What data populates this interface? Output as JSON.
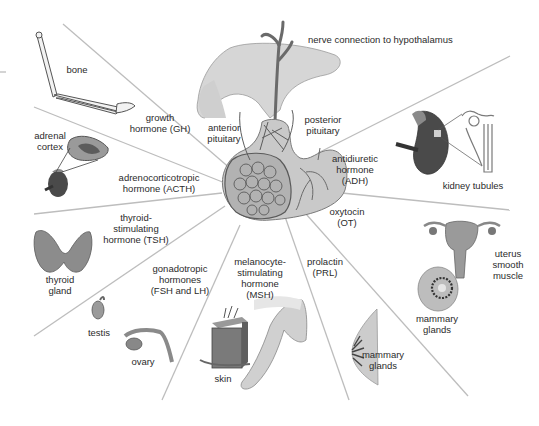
{
  "diagram": {
    "center": {
      "structure": "pituitary",
      "labels": {
        "nerve": "nerve connection to hypothalamus",
        "anterior": "anterior\npituitary",
        "posterior": "posterior\npituitary"
      }
    },
    "hormones": [
      {
        "id": "gh",
        "label": "growth\nhormone (GH)",
        "target": "bone"
      },
      {
        "id": "acth",
        "label": "adrenocorticotropic\nhormone (ACTH)",
        "target": "adrenal\ncortex"
      },
      {
        "id": "tsh",
        "label": "thyroid-\nstimulating\nhormone (TSH)",
        "target": "thyroid\ngland"
      },
      {
        "id": "fsh_lh",
        "label": "gonadotropic\nhormones\n(FSH and LH)",
        "targets": [
          "testis",
          "ovary"
        ]
      },
      {
        "id": "msh",
        "label": "melanocyte-\nstimulating\nhormone\n(MSH)",
        "target": "skin"
      },
      {
        "id": "prl",
        "label": "prolactin\n(PRL)",
        "target": "mammary\nglands"
      },
      {
        "id": "ot",
        "label": "oxytocin\n(OT)",
        "targets": [
          "uterus\nsmooth\nmuscle",
          "mammary\nglands"
        ]
      },
      {
        "id": "adh",
        "label": "antidiuretic\nhormone\n(ADH)",
        "target": "kidney tubules"
      }
    ],
    "colors": {
      "line": "#b8b8b8",
      "tissue_dark": "#5c5c5c",
      "tissue_mid": "#8f8f8f",
      "tissue_light": "#cfcfcf",
      "background": "#ffffff"
    }
  }
}
